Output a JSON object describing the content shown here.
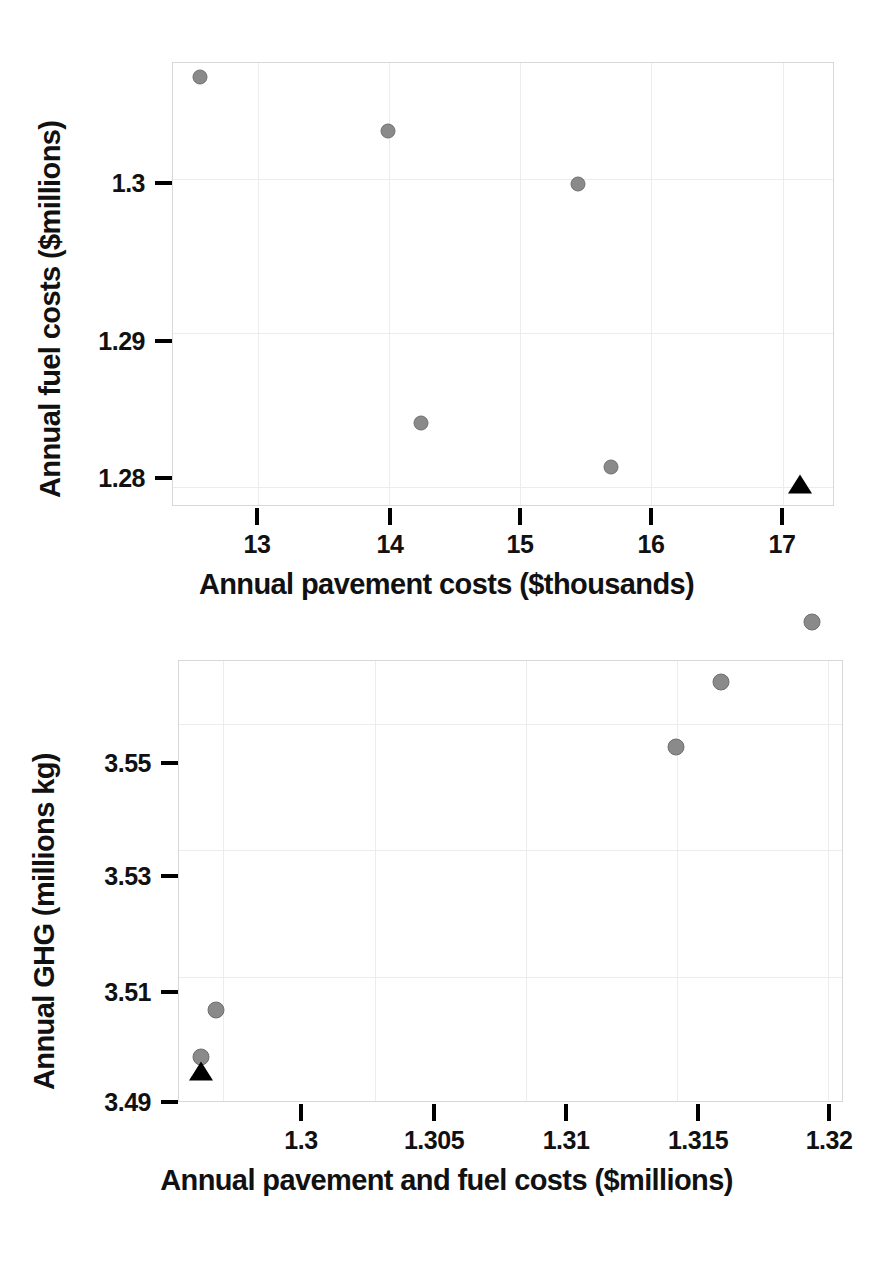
{
  "figure": {
    "background": "#ffffff",
    "marker_color": "#8a8a8a",
    "highlight_color": "#000000"
  },
  "chart_data": [
    {
      "id": "top",
      "type": "scatter",
      "title": "",
      "xlabel": "Annual pavement costs ($thousands)",
      "ylabel": "Annual fuel costs ($millions)",
      "xlim": [
        12.35,
        17.4
      ],
      "ylim": [
        1.2787,
        1.3075
      ],
      "xticks": [
        13,
        14,
        15,
        16,
        17
      ],
      "xticklabels": [
        "13",
        "14",
        "15",
        "16",
        "17"
      ],
      "yticks": [
        1.28,
        1.29,
        1.3
      ],
      "yticklabels": [
        "1.28",
        "1.29",
        "1.3"
      ],
      "grid": true,
      "legend": "none",
      "series": [
        {
          "name": "alternatives",
          "marker": "circle",
          "color": "#8a8a8a",
          "points": [
            {
              "x": 12.56,
              "y": 1.3065
            },
            {
              "x": 14.0,
              "y": 1.303
            },
            {
              "x": 15.45,
              "y": 1.2996
            },
            {
              "x": 14.25,
              "y": 1.2841
            },
            {
              "x": 15.7,
              "y": 1.2812
            }
          ]
        },
        {
          "name": "baseline",
          "marker": "triangle",
          "color": "#000000",
          "points": [
            {
              "x": 17.14,
              "y": 1.28
            }
          ]
        }
      ]
    },
    {
      "id": "bottom",
      "type": "scatter",
      "title": "",
      "xlabel": "Annual pavement and fuel costs ($millions)",
      "ylabel": "Annual GHG (millions kg)",
      "xlim": [
        1.29853,
        1.32053
      ],
      "ylim": [
        3.49,
        3.56
      ],
      "xticks": [
        1.3,
        1.305,
        1.31,
        1.315,
        1.32
      ],
      "xticklabels": [
        "1.3",
        "1.305",
        "1.31",
        "1.315",
        "1.32"
      ],
      "yticks": [
        3.49,
        3.51,
        3.53,
        3.55
      ],
      "yticklabels": [
        "3.49",
        "3.51",
        "3.53",
        "3.55"
      ],
      "grid": true,
      "legend": "none",
      "series": [
        {
          "name": "alternatives",
          "marker": "circle",
          "color": "#8a8a8a",
          "points": [
            {
              "x": 1.2993,
              "y": 3.4972
            },
            {
              "x": 1.2998,
              "y": 3.5045
            },
            {
              "x": 1.315,
              "y": 3.5462
            },
            {
              "x": 1.3165,
              "y": 3.5565
            },
            {
              "x": 1.3195,
              "y": 3.566
            }
          ]
        },
        {
          "name": "baseline",
          "marker": "triangle",
          "color": "#000000",
          "points": [
            {
              "x": 1.2993,
              "y": 3.4946
            }
          ]
        }
      ]
    }
  ]
}
